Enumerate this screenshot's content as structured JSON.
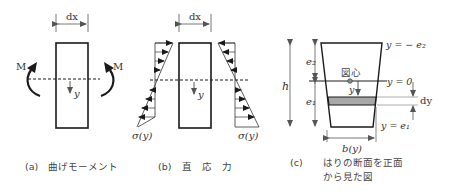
{
  "figure": {
    "panel_a": {
      "caption_tag": "(a)",
      "caption": "曲げモーメント",
      "dim_label": "dx",
      "moment_left": "M",
      "moment_right": "M",
      "axis_label": "y"
    },
    "panel_b": {
      "caption_tag": "(b)",
      "caption": "直　応　力",
      "dim_label": "dx",
      "axis_label": "y",
      "stress_left": "σ(y)",
      "stress_right": "σ(y)"
    },
    "panel_c": {
      "caption_tag": "(c)",
      "caption_line1": "はりの断面を正面",
      "caption_line2": "から見た図",
      "h_label": "h",
      "e2_label": "e₂",
      "e1_label": "e₁",
      "centroid_label": "図心",
      "y_label": "y",
      "top_label": "y = − e₂",
      "mid_label": "y = 0",
      "bottom_label": "y = e₁",
      "dy_label": "dy",
      "width_label": "b(y)"
    },
    "colors": {
      "line": "#1a1a1a",
      "strip_fill": "#a8a8a8",
      "text": "#333333"
    }
  }
}
